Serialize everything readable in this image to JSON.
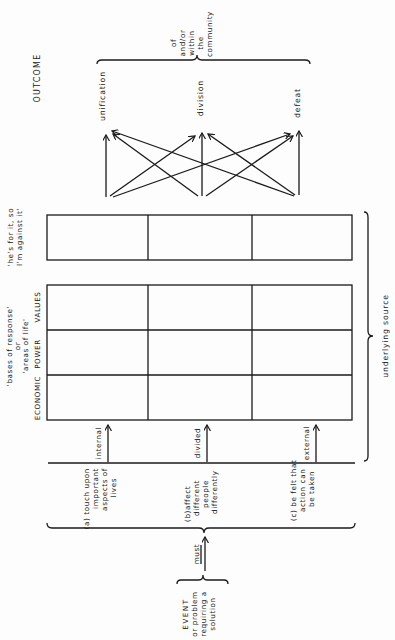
{
  "outcome": {
    "title": "OUTCOME",
    "items": [
      "unification",
      "division",
      "defeat"
    ],
    "scope_lines": [
      "of",
      "and/or",
      "within",
      "the",
      "community"
    ]
  },
  "rejection_box": {
    "label_lines": [
      "'he's for it, so",
      "I'm against it'"
    ]
  },
  "bases": {
    "label_lines": [
      "'bases of response'",
      "or",
      "'areas of life'"
    ],
    "columns": [
      "ECONOMIC",
      "POWER",
      "VALUES"
    ]
  },
  "community_states": [
    "internal",
    "divided",
    "external"
  ],
  "underlying_source": "underlying source",
  "conditions": [
    [
      "(a) touch upon",
      "important",
      "aspects of",
      "lives"
    ],
    [
      "(b)affect",
      "different",
      "people",
      "differently"
    ],
    [
      "(c) be felt that",
      "action can",
      "be taken"
    ]
  ],
  "must_label": "must",
  "event": {
    "lines": [
      "EVENT",
      "or problem",
      "requiring a",
      "solution"
    ]
  }
}
